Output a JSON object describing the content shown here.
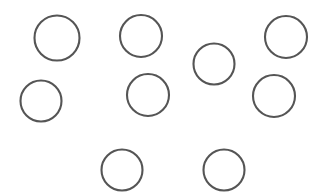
{
  "figure": {
    "background_color": "#ffffff",
    "stroke_color": "#555555",
    "stroke_width": 2.1,
    "width": 320,
    "height": 196,
    "shape_count": 9,
    "shape_kind": "circle",
    "shape_fill": "none"
  },
  "chart_data": {
    "type": "scatter",
    "subtitle": "",
    "xlabel": "",
    "ylabel": "",
    "xlim": [
      0,
      320
    ],
    "ylim": [
      0,
      196
    ],
    "grid": false,
    "legend": "none",
    "axes_visible": false,
    "marker": "open-circle",
    "marker_edge_color": "#555555",
    "marker_face_color": "none",
    "marker_edge_width": 2.1,
    "point_count": 9,
    "series": [
      {
        "name": "circles",
        "points": [
          {
            "label": "circle-1",
            "x": 57,
            "y": 38,
            "diameter": 45,
            "radius": 22.5
          },
          {
            "label": "circle-2",
            "x": 141,
            "y": 36,
            "diameter": 42,
            "radius": 21
          },
          {
            "label": "circle-3",
            "x": 214,
            "y": 64,
            "diameter": 41,
            "radius": 20.5
          },
          {
            "label": "circle-4",
            "x": 286,
            "y": 37,
            "diameter": 42,
            "radius": 21
          },
          {
            "label": "circle-5",
            "x": 41,
            "y": 101,
            "diameter": 41,
            "radius": 20.5
          },
          {
            "label": "circle-6",
            "x": 148,
            "y": 95,
            "diameter": 42,
            "radius": 21
          },
          {
            "label": "circle-7",
            "x": 274,
            "y": 96,
            "diameter": 42,
            "radius": 21
          },
          {
            "label": "circle-8",
            "x": 122,
            "y": 170,
            "diameter": 41,
            "radius": 20.5
          },
          {
            "label": "circle-9",
            "x": 224,
            "y": 170,
            "diameter": 41,
            "radius": 20.5
          }
        ]
      }
    ]
  }
}
